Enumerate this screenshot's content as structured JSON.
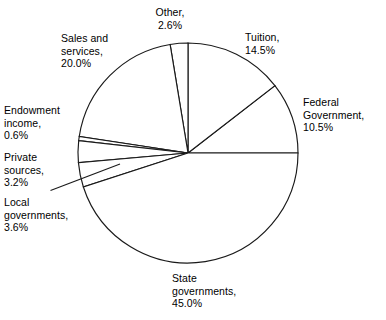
{
  "chart_data": {
    "type": "pie",
    "title": "",
    "subtitle": "",
    "xlabel": "",
    "ylabel": "",
    "legend_position": "labels-outside",
    "grid": false,
    "units": "percent",
    "total": 100.0,
    "start_angle_deg": 0,
    "direction": "counterclockwise",
    "categories": [
      "Federal Government",
      "Tuition",
      "Other",
      "Sales and services",
      "Endowment income",
      "Private sources",
      "Local governments",
      "State governments"
    ],
    "values": [
      10.5,
      14.5,
      2.6,
      20.0,
      0.6,
      3.2,
      3.6,
      45.0
    ],
    "slices": [
      {
        "name": "Federal Government",
        "value": 10.5,
        "value_label": "10.5%",
        "label_lines": "Federal\nGovernment,\n10.5%",
        "start_deg": 0.0,
        "end_deg": 37.8
      },
      {
        "name": "Tuition",
        "value": 14.5,
        "value_label": "14.5%",
        "label_lines": "Tuition,\n14.5%",
        "start_deg": 37.8,
        "end_deg": 90.0
      },
      {
        "name": "Other",
        "value": 2.6,
        "value_label": "2.6%",
        "label_lines": "Other,\n2.6%",
        "start_deg": 90.0,
        "end_deg": 99.36
      },
      {
        "name": "Sales and services",
        "value": 20.0,
        "value_label": "20.0%",
        "label_lines": "Sales and\nservices,\n20.0%",
        "start_deg": 99.36,
        "end_deg": 171.36
      },
      {
        "name": "Endowment income",
        "value": 0.6,
        "value_label": "0.6%",
        "label_lines": "Endowment\nincome,\n0.6%",
        "start_deg": 171.36,
        "end_deg": 173.52
      },
      {
        "name": "Private sources",
        "value": 3.2,
        "value_label": "3.2%",
        "label_lines": "Private\nsources,\n3.2%",
        "start_deg": 173.52,
        "end_deg": 185.04
      },
      {
        "name": "Local governments",
        "value": 3.6,
        "value_label": "3.6%",
        "label_lines": "Local\ngovernments,\n3.6%",
        "start_deg": 185.04,
        "end_deg": 198.0
      },
      {
        "name": "State governments",
        "value": 45.0,
        "value_label": "45.0%",
        "label_lines": "State\ngovernments,\n45.0%",
        "start_deg": 198.0,
        "end_deg": 360.0
      }
    ],
    "colors": {
      "slice_fill": "#ffffff",
      "outline": "#1a1a1a",
      "text": "#000000",
      "background": "#ffffff"
    }
  },
  "labels": {
    "other": "Other,\n2.6%",
    "tuition": "Tuition,\n14.5%",
    "federal_government": "Federal\nGovernment,\n10.5%",
    "sales_and_services": "Sales and\nservices,\n20.0%",
    "endowment_income": "Endowment\nincome,\n0.6%",
    "private_sources": "Private\nsources,\n3.2%",
    "local_governments": "Local\ngovernments,\n3.6%",
    "state_governments": "State\ngovernments,\n45.0%"
  }
}
